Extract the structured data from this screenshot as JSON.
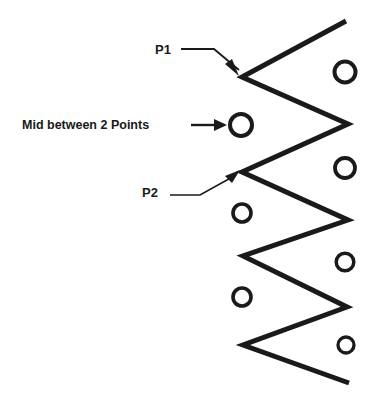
{
  "figure": {
    "background_color": "#ffffff",
    "stroke_color": "#1a1a1a",
    "width": 384,
    "height": 404
  },
  "annotations": {
    "p1": {
      "label": "P1",
      "x": 155,
      "y": 51,
      "leader": "M 181 49 L 214 49 L 239 70",
      "head": "239,76 225,64 232,59"
    },
    "p2": {
      "label": "P2",
      "x": 142,
      "y": 194,
      "leader": "M 170 195 L 200 195 L 236 175",
      "head": "240,170 225,176 232,183"
    },
    "mid": {
      "label": "Mid between 2 Points",
      "x": 22,
      "y": 126,
      "leader": "M 191 125 L 218 125",
      "head": "227,125 214,119 214,131"
    }
  },
  "zigzag": {
    "stroke_width": 5,
    "points": "346,21 242,77 348,124 242,172 348,220 243,256 347,307 243,345 349,383",
    "vertices": [
      {
        "name": "top-end",
        "x": 346,
        "y": 21
      },
      {
        "name": "p1-vertex",
        "x": 242,
        "y": 77
      },
      {
        "name": "right-vertex-1",
        "x": 348,
        "y": 124
      },
      {
        "name": "p2-vertex",
        "x": 242,
        "y": 172
      },
      {
        "name": "right-vertex-2",
        "x": 348,
        "y": 220
      },
      {
        "name": "left-vertex-3",
        "x": 243,
        "y": 256
      },
      {
        "name": "right-vertex-3",
        "x": 347,
        "y": 307
      },
      {
        "name": "left-vertex-4",
        "x": 243,
        "y": 345
      },
      {
        "name": "bottom-end",
        "x": 349,
        "y": 383
      }
    ]
  },
  "circles": [
    {
      "name": "mid-circle-1",
      "cx": 241,
      "cy": 125,
      "r": 11.0,
      "stroke_width": 4.0,
      "side": "left"
    },
    {
      "name": "left-circle-2",
      "cx": 242,
      "cy": 213,
      "r": 9.0,
      "stroke_width": 3.6,
      "side": "left"
    },
    {
      "name": "left-circle-3",
      "cx": 242,
      "cy": 297,
      "r": 9.0,
      "stroke_width": 3.6,
      "side": "left"
    },
    {
      "name": "right-circle-1",
      "cx": 345,
      "cy": 72,
      "r": 10.5,
      "stroke_width": 4.0,
      "side": "right"
    },
    {
      "name": "right-circle-2",
      "cx": 345,
      "cy": 168,
      "r": 10.0,
      "stroke_width": 3.8,
      "side": "right"
    },
    {
      "name": "right-circle-3",
      "cx": 345,
      "cy": 262,
      "r": 8.8,
      "stroke_width": 3.5,
      "side": "right"
    },
    {
      "name": "right-circle-4",
      "cx": 346,
      "cy": 345,
      "r": 8.0,
      "stroke_width": 3.3,
      "side": "right"
    }
  ]
}
